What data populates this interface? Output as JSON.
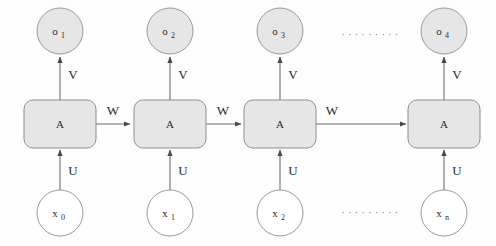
{
  "diagram": {
    "type": "rnn-unrolled-diagram",
    "colors": {
      "node_fill": "#e6e6e6",
      "node_stroke": "#9a9a9a",
      "input_fill": "#ffffff",
      "input_stroke": "#9a9a9a",
      "box_fill": "#e6e6e6",
      "box_stroke": "#8f8f8f",
      "arrow": "#6e6e6e",
      "text": "#2b2b2b",
      "background": "#fdfdfd"
    },
    "weight_labels": {
      "input_to_hidden": "U",
      "hidden_to_hidden": "W",
      "hidden_to_output": "V"
    },
    "hidden_label": "A",
    "ellipsis": "· · · · · · · · ·",
    "timesteps": [
      {
        "index": 0,
        "output_base": "o",
        "output_sub": "1",
        "hidden": "A",
        "input_base": "x",
        "input_sub": "0",
        "v_label": "V",
        "u_label": "U",
        "w_label": "W",
        "has_w_out": true
      },
      {
        "index": 1,
        "output_base": "o",
        "output_sub": "2",
        "hidden": "A",
        "input_base": "x",
        "input_sub": "1",
        "v_label": "V",
        "u_label": "U",
        "w_label": "W",
        "has_w_out": true
      },
      {
        "index": 2,
        "output_base": "o",
        "output_sub": "3",
        "hidden": "A",
        "input_base": "x",
        "input_sub": "2",
        "v_label": "V",
        "u_label": "U",
        "w_label": "W",
        "has_w_out": true
      },
      {
        "index": 3,
        "output_base": "o",
        "output_sub": "4",
        "hidden": "A",
        "input_base": "x",
        "input_sub": "n",
        "v_label": "V",
        "u_label": "U",
        "w_label": "",
        "has_w_out": false
      }
    ]
  }
}
